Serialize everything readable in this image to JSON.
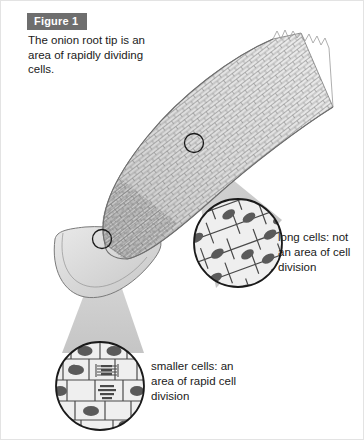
{
  "figure": {
    "label": "Figure 1",
    "caption": "The onion root tip is an area of rapidly dividing cells.",
    "label_bg": "#6e6e6e",
    "label_color": "#ffffff",
    "background": "#ffffff",
    "border_color": "#e3e3e3"
  },
  "diagram": {
    "root_fill": "#d8d8d8",
    "root_cap_fill": "#d0d0d0",
    "cell_line_color": "#6d6d6d",
    "cone_fill": "#c9c9c9",
    "circle_outline": "#1a1a1a",
    "magnified_cell_fill": "#efefef",
    "nucleus_fill": "#5a5a5a"
  },
  "callouts": [
    {
      "id": "long-cells",
      "text": "long cells: not an area of cell division",
      "region": "upper root, elongation zone",
      "cell_shape": "elongated rectangular cells with oval nuclei"
    },
    {
      "id": "smaller-cells",
      "text": "smaller cells: an area of rapid cell division",
      "region": "root tip, meristem",
      "cell_shape": "small cells, several showing mitotic chromosome figures"
    }
  ]
}
